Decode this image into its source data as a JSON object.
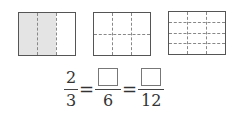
{
  "figures": [
    {
      "id": "rect-1",
      "columns": 3,
      "rows": 1,
      "shaded_columns": 2,
      "shade_color": "#e4e4e4"
    },
    {
      "id": "rect-2",
      "columns": 3,
      "rows": 2,
      "shaded_columns": 0
    },
    {
      "id": "rect-3",
      "columns": 3,
      "rows": 4,
      "shaded_columns": 0
    }
  ],
  "equation": {
    "frac1": {
      "numerator": "2",
      "denominator": "3"
    },
    "equals": "=",
    "frac2": {
      "numerator": "",
      "denominator": "6"
    },
    "frac3": {
      "numerator": "",
      "denominator": "12"
    }
  }
}
